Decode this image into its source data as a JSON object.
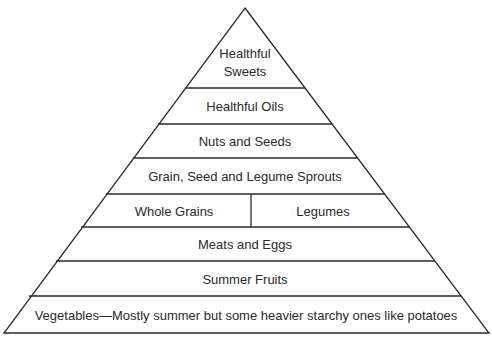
{
  "diagram": {
    "type": "food-pyramid",
    "layers": [
      {
        "id": "healthful-sweets",
        "lines": [
          "Healthful",
          "Sweets"
        ]
      },
      {
        "id": "healthful-oils",
        "lines": [
          "Healthful Oils"
        ]
      },
      {
        "id": "nuts-and-seeds",
        "lines": [
          "Nuts and Seeds"
        ]
      },
      {
        "id": "sprouts",
        "lines": [
          "Grain, Seed and Legume Sprouts"
        ]
      },
      {
        "id": "grains-legumes",
        "split": true,
        "left": "Whole Grains",
        "right": "Legumes"
      },
      {
        "id": "meats-eggs",
        "lines": [
          "Meats and Eggs"
        ]
      },
      {
        "id": "summer-fruits",
        "lines": [
          "Summer Fruits"
        ]
      },
      {
        "id": "vegetables",
        "lines": [
          "Vegetables—Mostly summer but some heavier starchy ones like potatoes"
        ]
      }
    ],
    "colors": {
      "line": "#2a2a2a",
      "text": "#2a2a2a",
      "background": "#ffffff"
    }
  }
}
